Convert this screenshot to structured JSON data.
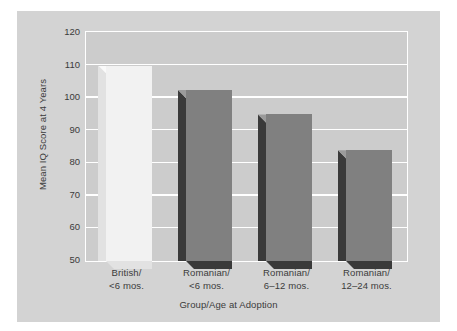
{
  "chart_data": {
    "type": "bar",
    "title": "",
    "xlabel": "Group/Age at Adoption",
    "ylabel": "Mean IQ Score at 4 Years",
    "categories": [
      "British/\n<6 mos.",
      "Romanian/\n<6 mos.",
      "Romanian/\n6–12 mos.",
      "Romanian/\n12–24 mos."
    ],
    "category_lines": [
      [
        "British/",
        "<6 mos."
      ],
      [
        "Romanian/",
        "<6 mos."
      ],
      [
        "Romanian/",
        "6–12 mos."
      ],
      [
        "Romanian/",
        "12–24 mos."
      ]
    ],
    "values": [
      110,
      102.5,
      95,
      84
    ],
    "ylim": [
      50,
      120
    ],
    "ytick_labels": [
      "120",
      "110",
      "100",
      "90",
      "80",
      "70",
      "60",
      "50"
    ],
    "ytick_values": [
      120,
      110,
      100,
      90,
      80,
      70,
      60,
      50
    ],
    "grid": true,
    "legend": "none",
    "bar_styles": [
      {
        "face": "#f2f2f2",
        "side": "#e2e2e2",
        "top": "#fafafa"
      },
      {
        "face": "#808080",
        "side": "#3a3a3a",
        "top": "#9b9b9b"
      },
      {
        "face": "#808080",
        "side": "#3a3a3a",
        "top": "#9b9b9b"
      },
      {
        "face": "#808080",
        "side": "#3a3a3a",
        "top": "#9b9b9b"
      }
    ]
  },
  "colors": {
    "page_background": "#ffffff",
    "figure_background": "#d3d3d3",
    "plot_background": "#cccccc",
    "gridline": "#ffffff",
    "text": "#3b3b3b"
  }
}
